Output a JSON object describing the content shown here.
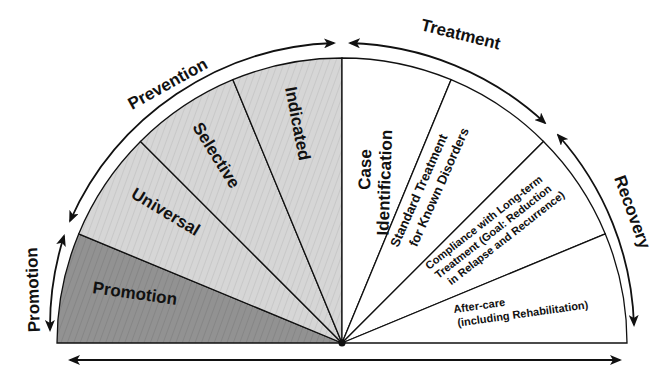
{
  "diagram": {
    "type": "semicircle-spectrum",
    "center": {
      "x": 342,
      "y": 343
    },
    "inner_radius": 285,
    "colors": {
      "promotion_fill": "#8f8f8f",
      "prevention_fill": "#d4d4d4",
      "treatment_fill": "#ffffff",
      "stroke": "#111111"
    },
    "segments": [
      {
        "id": "promotion",
        "label": "Promotion",
        "group": "promotion"
      },
      {
        "id": "universal",
        "label": "Universal",
        "group": "prevention"
      },
      {
        "id": "selective",
        "label": "Selective",
        "group": "prevention"
      },
      {
        "id": "indicated",
        "label": "Indicated",
        "group": "prevention"
      },
      {
        "id": "case-identification",
        "label_lines": [
          "Case",
          "Identification"
        ],
        "group": "treatment"
      },
      {
        "id": "standard-treatment",
        "label_lines": [
          "Standard Treatment",
          "for Known Disorders"
        ],
        "group": "treatment"
      },
      {
        "id": "compliance",
        "label_lines": [
          "Compliance with Long-term",
          "Treatment (Goal: Reduction",
          "in Relapse and Recurrence)"
        ],
        "group": "recovery"
      },
      {
        "id": "after-care",
        "label_lines": [
          "After-care",
          "(including Rehabilitation)"
        ],
        "group": "recovery"
      }
    ],
    "outer_arcs": [
      {
        "id": "promotion",
        "label": "Promotion"
      },
      {
        "id": "prevention",
        "label": "Prevention"
      },
      {
        "id": "treatment",
        "label": "Treatment"
      },
      {
        "id": "recovery",
        "label": "Recovery"
      }
    ],
    "baseline_arrow": {
      "direction": "double-headed"
    }
  }
}
